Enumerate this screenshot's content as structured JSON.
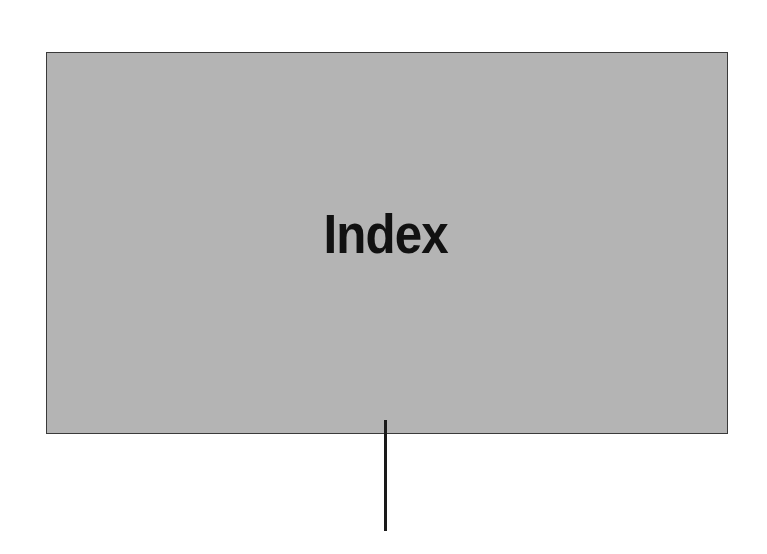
{
  "diagram": {
    "box": {
      "label": "Index",
      "fill_color": "#b4b4b4",
      "border_color": "#3a3a3a"
    },
    "connector": {
      "direction": "down",
      "color": "#1a1a1a"
    }
  }
}
